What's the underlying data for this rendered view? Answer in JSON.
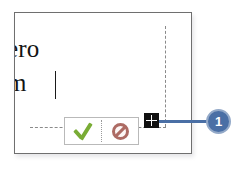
{
  "screenshot": {
    "width": 249,
    "height": 172,
    "background": "#ffffff"
  },
  "panel": {
    "name": "cell-edit-panel",
    "border_color": "#6f6f6f",
    "background": "#ffffff",
    "document_text": {
      "line1": "ero",
      "line2": "m",
      "caret_visible": true
    }
  },
  "guides": {
    "vertical_dashed_label": "column boundary guide",
    "horizontal_dashed_label": "row boundary guide",
    "color": "#8a8a8a"
  },
  "toolbar": {
    "name": "accept-cancel-toolbar",
    "border_color": "#b9b9b9",
    "buttons": [
      {
        "name": "accept-button",
        "icon": "check-icon",
        "label": "",
        "color": "#79ac35"
      },
      {
        "name": "cancel-button",
        "icon": "no-entry-icon",
        "label": "",
        "color": "#ad6b64"
      }
    ]
  },
  "handle": {
    "name": "grid-move-handle",
    "icon": "grid-handle-icon",
    "color": "#111111"
  },
  "callout": {
    "name": "callout-1",
    "number": "1",
    "badge_color": "#4a6fa5",
    "badge_ring_color": "#93a9c8",
    "leader_color": "#4a6fa5"
  }
}
